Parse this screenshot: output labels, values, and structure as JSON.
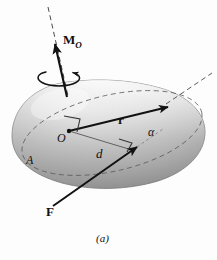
{
  "figure": {
    "caption": "(a)",
    "background_color": "#fdfdfd",
    "labels": {
      "moment_vector": "M",
      "moment_subscript": "O",
      "position_vector": "r",
      "angle": "α",
      "origin_point": "O",
      "body_label": "A",
      "moment_arm": "d",
      "force_vector": "F"
    },
    "icon_names": {
      "rotation_sense": "curved-rotation-arrow-icon",
      "right_angle_at_O": "right-angle-marker-icon",
      "right_angle_at_d": "right-angle-marker-icon"
    },
    "colors": {
      "ink": "#111111",
      "dashed_line": "#555555",
      "body_light": "#f2f2f2",
      "body_mid": "#c9c9c9",
      "body_dark": "#8e8e8e",
      "body_edge": "#6f6f6f"
    }
  }
}
